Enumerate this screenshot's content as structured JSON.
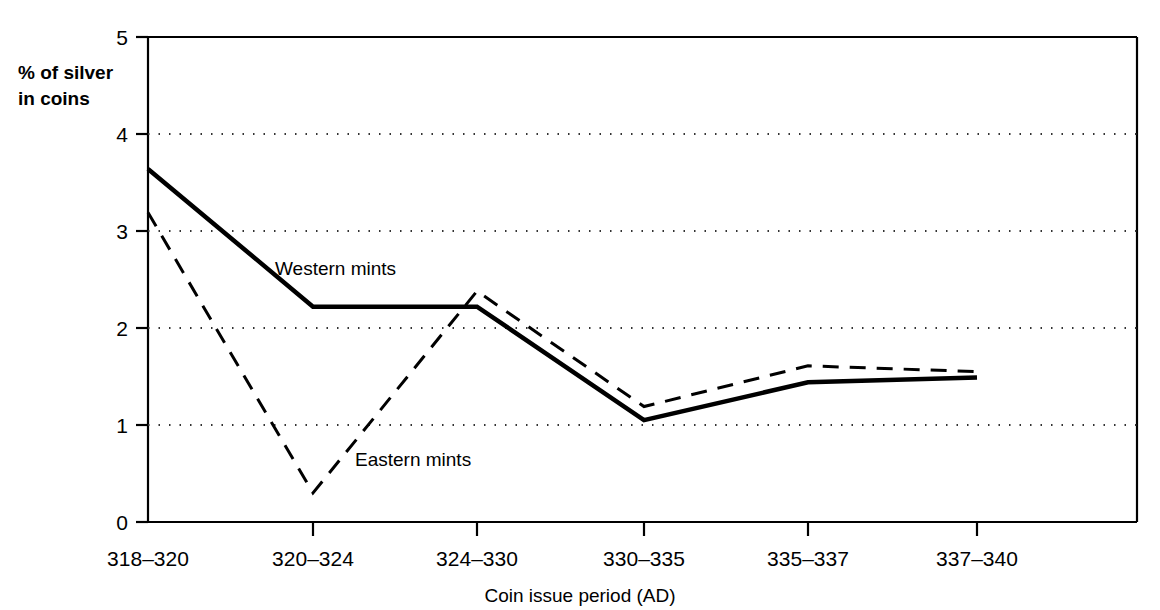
{
  "chart_data": {
    "type": "line",
    "title": "",
    "subtitle": "",
    "xlabel": "Coin issue period  (AD)",
    "ylabel": "% of silver in coins",
    "ylabel_line1": "% of silver",
    "ylabel_line2": "in coins",
    "categories": [
      "318–320",
      "320–324",
      "324–330",
      "330–335",
      "335–337",
      "337–340"
    ],
    "ylim": [
      0,
      5
    ],
    "yticks": [
      "0",
      "1",
      "2",
      "3",
      "4",
      "5"
    ],
    "ytick_values": [
      0,
      1,
      2,
      3,
      4,
      5
    ],
    "grid": "horizontal-dotted",
    "legend_position": "inline-annotations",
    "series": [
      {
        "name": "Western mints",
        "style": "solid",
        "color": "#000000",
        "values": [
          3.64,
          2.22,
          2.22,
          1.05,
          1.44,
          1.49
        ]
      },
      {
        "name": "Eastern mints",
        "style": "dashed",
        "color": "#000000",
        "values": [
          3.19,
          0.3,
          2.38,
          1.19,
          1.61,
          1.55
        ]
      }
    ],
    "annotations": [
      {
        "text": "Western mints",
        "x_px": 275,
        "y_px": 275
      },
      {
        "text": "Eastern mints",
        "x_px": 355,
        "y_px": 466
      }
    ]
  },
  "axis": {
    "y_tick_0": "0",
    "y_tick_1": "1",
    "y_tick_2": "2",
    "y_tick_3": "3",
    "y_tick_4": "4",
    "y_tick_5": "5",
    "x_tick_0": "318–320",
    "x_tick_1": "320–324",
    "x_tick_2": "324–330",
    "x_tick_3": "330–335",
    "x_tick_4": "335–337",
    "x_tick_5": "337–340",
    "x_title": "Coin issue period  (AD)",
    "y_title_line1": "% of silver",
    "y_title_line2": "in coins"
  },
  "series_labels": {
    "western": "Western mints",
    "eastern": "Eastern mints"
  },
  "colors": {
    "ink": "#000000",
    "grid": "#555555",
    "background": "#ffffff"
  }
}
